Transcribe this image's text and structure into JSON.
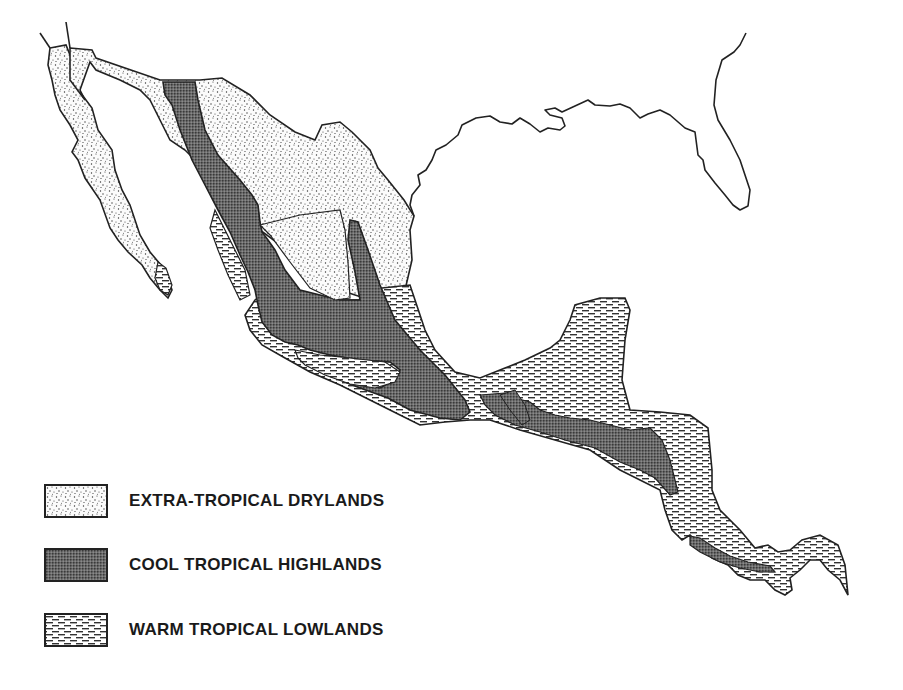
{
  "map": {
    "region": "Mexico and Central America",
    "colors": {
      "outline": "#222222",
      "background": "#ffffff",
      "drylands_dots": "#333333",
      "highlands_fill": "#555555",
      "lowlands_dash": "#333333"
    }
  },
  "legend": {
    "items": [
      {
        "key": "drylands",
        "label": "EXTRA-TROPICAL DRYLANDS",
        "pattern": "stipple"
      },
      {
        "key": "highlands",
        "label": "COOL TROPICAL HIGHLANDS",
        "pattern": "dense-grid"
      },
      {
        "key": "lowlands",
        "label": "WARM TROPICAL LOWLANDS",
        "pattern": "dashes"
      }
    ]
  }
}
